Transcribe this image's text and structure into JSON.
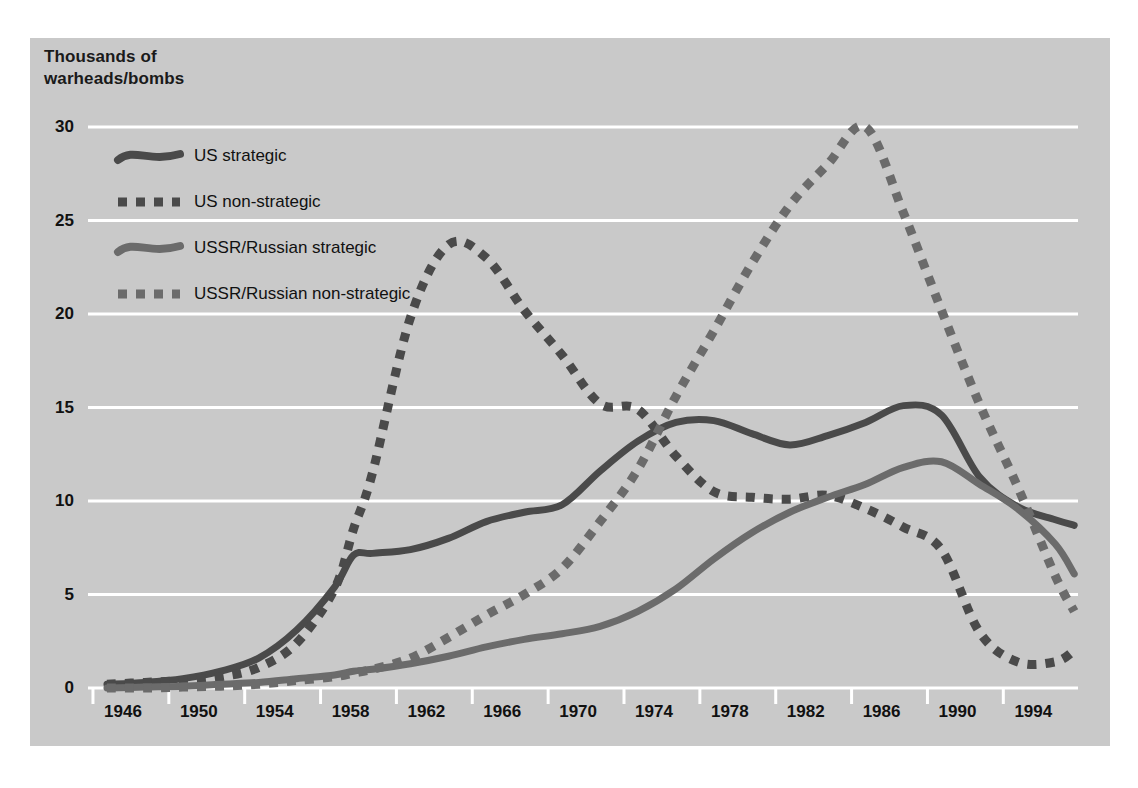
{
  "figure": {
    "axis_title": "Thousands of\nwarheads/bombs",
    "panel_color": "#c9c9c9",
    "gridline_color": "#ffffff",
    "us_color": "#4a4a4a",
    "ussr_color": "#6b6b6b"
  },
  "legend": {
    "items": [
      {
        "label": "US strategic",
        "style": "solid",
        "color": "#4a4a4a"
      },
      {
        "label": "US non-strategic",
        "style": "dotted",
        "color": "#4a4a4a"
      },
      {
        "label": "USSR/Russian strategic",
        "style": "solid",
        "color": "#6b6b6b"
      },
      {
        "label": "USSR/Russian non-strategic",
        "style": "dotted",
        "color": "#6b6b6b"
      }
    ]
  },
  "chart_data": {
    "type": "line",
    "title": "",
    "xlabel": "",
    "ylabel": "Thousands of warheads/bombs",
    "xlim": [
      1945.0,
      1997.2
    ],
    "ylim": [
      0,
      30
    ],
    "yticks": [
      0,
      5,
      10,
      15,
      20,
      25,
      30
    ],
    "ytick_labels": [
      "0",
      "5",
      "10",
      "15",
      "20",
      "25",
      "30"
    ],
    "xticks": [
      1946,
      1950,
      1954,
      1958,
      1962,
      1966,
      1970,
      1974,
      1978,
      1982,
      1986,
      1990,
      1994
    ],
    "xtick_labels": [
      "1946",
      "1950",
      "1954",
      "1958",
      "1962",
      "1966",
      "1970",
      "1974",
      "1978",
      "1982",
      "1986",
      "1990",
      "1994"
    ],
    "grid": true,
    "legend_position": "upper-left-inside",
    "x": [
      1946,
      1948,
      1950,
      1952,
      1954,
      1956,
      1958,
      1959,
      1960,
      1962,
      1964,
      1966,
      1968,
      1970,
      1972,
      1974,
      1976,
      1978,
      1980,
      1982,
      1984,
      1986,
      1988,
      1990,
      1992,
      1994,
      1996,
      1997
    ],
    "series": [
      {
        "name": "US strategic",
        "style": "solid",
        "color": "#4a4a4a",
        "values": [
          0.2,
          0.3,
          0.5,
          0.9,
          1.6,
          3.1,
          5.4,
          7.1,
          7.2,
          7.4,
          8.0,
          8.9,
          9.4,
          9.8,
          11.6,
          13.2,
          14.2,
          14.3,
          13.6,
          13.0,
          13.5,
          14.2,
          15.1,
          14.6,
          11.3,
          9.7,
          9.0,
          8.7
        ]
      },
      {
        "name": "US non-strategic",
        "style": "dotted",
        "color": "#4a4a4a",
        "values": [
          0.2,
          0.3,
          0.4,
          0.6,
          1.1,
          2.4,
          5.3,
          8.5,
          11.5,
          19.8,
          23.7,
          23.0,
          20.2,
          17.8,
          15.2,
          14.9,
          12.4,
          10.5,
          10.2,
          10.1,
          10.3,
          9.6,
          8.6,
          7.4,
          3.0,
          1.4,
          1.4,
          2.0
        ]
      },
      {
        "name": "USSR/Russian strategic",
        "style": "solid",
        "color": "#6b6b6b",
        "values": [
          0.0,
          0.05,
          0.1,
          0.2,
          0.3,
          0.5,
          0.7,
          0.9,
          1.0,
          1.3,
          1.7,
          2.2,
          2.6,
          2.9,
          3.3,
          4.1,
          5.3,
          6.9,
          8.3,
          9.4,
          10.2,
          10.9,
          11.8,
          12.1,
          10.9,
          9.6,
          7.7,
          6.1
        ]
      },
      {
        "name": "USSR/Russian non-strategic",
        "style": "dotted",
        "color": "#6b6b6b",
        "values": [
          0.0,
          0.0,
          0.05,
          0.1,
          0.2,
          0.4,
          0.6,
          0.8,
          1.0,
          1.6,
          2.7,
          3.9,
          5.0,
          6.4,
          8.9,
          11.7,
          15.6,
          19.1,
          22.7,
          25.8,
          28.0,
          30.0,
          25.4,
          20.2,
          15.2,
          10.8,
          6.0,
          4.1
        ]
      }
    ]
  }
}
